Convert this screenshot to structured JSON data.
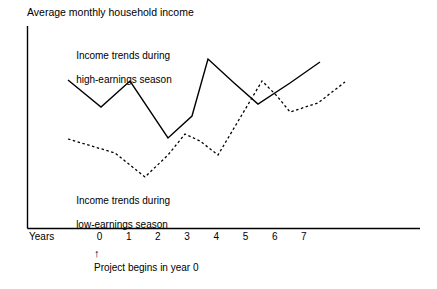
{
  "figure": {
    "title": "Average monthly household income",
    "width": 437,
    "height": 289,
    "background_color": "#ffffff",
    "line_color": "#000000"
  },
  "axes": {
    "x_axis_label": "Years",
    "x_tick_labels": [
      "0",
      "1",
      "2",
      "3",
      "4",
      "5",
      "6",
      "7"
    ],
    "y_axis_label": "",
    "grid": false
  },
  "annotations": {
    "arrow_glyph": "↑",
    "arrow_icon_name": "up-arrow-icon",
    "note": "Project begins in year 0"
  },
  "series_labels": {
    "high_line1": "Income trends during",
    "high_line2": "high-earnings season",
    "low_line1": "Income trends during",
    "low_line2": "low-earnings season"
  },
  "chart_data": {
    "type": "line",
    "title": "Average monthly household income",
    "xlabel": "Years",
    "ylabel": "Average monthly household income",
    "grid": false,
    "legend": "inline-annotations",
    "x_tick_labels": [
      "0",
      "1",
      "2",
      "3",
      "4",
      "5",
      "6",
      "7"
    ],
    "x": [
      -1,
      0,
      1,
      2,
      3,
      4,
      5,
      6,
      7,
      8
    ],
    "xlim": [
      -1,
      8
    ],
    "ylim": [
      0,
      10
    ],
    "series": [
      {
        "name": "Income trends during high-earnings season",
        "style": "solid",
        "color": "#000000",
        "x": [
          -1,
          0,
          1,
          2,
          3,
          4,
          5,
          6,
          7
        ],
        "values": [
          7.4,
          5.8,
          7.3,
          3.9,
          6.1,
          8.8,
          6.2,
          7.4,
          8.6
        ]
      },
      {
        "name": "Income trends during low-earnings season",
        "style": "dotted",
        "color": "#000000",
        "x": [
          -1,
          0,
          1,
          2,
          3,
          4,
          5,
          6,
          7,
          8
        ],
        "values": [
          4.0,
          3.4,
          3.1,
          1.7,
          4.1,
          2.8,
          4.4,
          7.1,
          5.3,
          6.9
        ]
      }
    ]
  }
}
